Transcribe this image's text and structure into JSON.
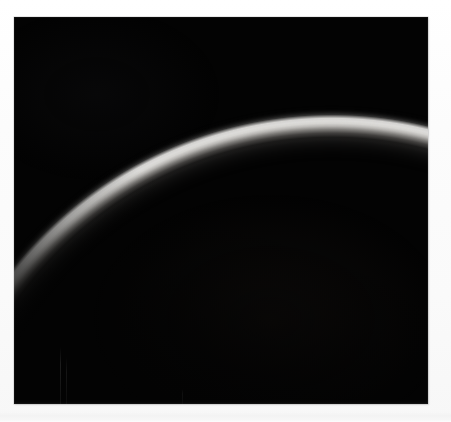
{
  "image": {
    "kind": "photograph",
    "subject": "crescent-limb-of-planet",
    "caption": "Thin illuminated crescent limb of a planetary body against black space",
    "width_px": 451,
    "height_px": 422
  },
  "page": {
    "background_color": "#fbfbfb",
    "bottom_band_color": "#f3f3f3"
  },
  "photo": {
    "name": "crescent-limb-photo",
    "left_px": 14,
    "top_px": 17,
    "width_px": 414,
    "height_px": 387,
    "sky_color": "#030303",
    "limb_highlight_color": "#f1f0ee",
    "limb_midtone_color": "#82807d",
    "limb_shadow_color": "#1a1918"
  },
  "limb": {
    "name": "crescent-arc",
    "shape": "circular-limb",
    "apex_x_px": 280,
    "apex_y_px": 133,
    "exits_right_edge_y_px": 195,
    "fades_out_near_x_px": 58,
    "fades_out_near_y_px": 390,
    "brightest_region": "top-and-upper-right",
    "faintest_region": "lower-left-tail"
  },
  "annotations": {
    "alt_text": "A dark astronomical photograph showing a bright, thin crescent of light curving from the lower-left of the frame up over the top and off the right edge, with the rest of the frame in near-total blackness."
  }
}
